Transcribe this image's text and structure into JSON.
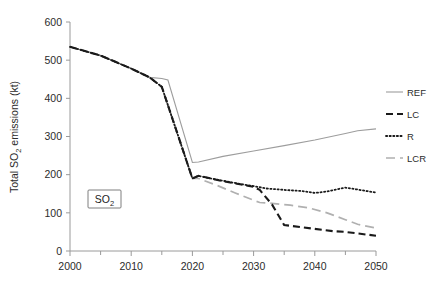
{
  "chart_data": {
    "type": "line",
    "title": "",
    "xlabel": "",
    "ylabel_parts": {
      "pre": "Total SO",
      "sub": "2",
      "post": " emissions (kt)"
    },
    "ylabel": "Total SO2 emissions (kt)",
    "xlim": [
      2000,
      2050
    ],
    "ylim": [
      0,
      600
    ],
    "xticks": [
      2000,
      2010,
      2020,
      2030,
      2040,
      2050
    ],
    "xticks_minor": [
      2005,
      2015,
      2025,
      2035,
      2045
    ],
    "yticks": [
      0,
      100,
      200,
      300,
      400,
      500,
      600
    ],
    "grid": false,
    "legend_position": "right",
    "annotations": [
      {
        "name": "so2-box",
        "text_pre": "SO",
        "text_sub": "2",
        "text": "SO2",
        "x": 2006.5,
        "y": 135
      }
    ],
    "series": [
      {
        "name": "REF",
        "style": "solid-thin-gray",
        "color": "#9d9d9d",
        "x": [
          2000,
          2005,
          2010,
          2013,
          2015,
          2016,
          2020,
          2021,
          2025,
          2030,
          2035,
          2040,
          2045,
          2047,
          2050
        ],
        "values": [
          535,
          512,
          478,
          455,
          452,
          448,
          232,
          233,
          248,
          262,
          276,
          291,
          308,
          315,
          320
        ]
      },
      {
        "name": "LC",
        "style": "dashed-black",
        "color": "#1a1a1a",
        "x": [
          2000,
          2005,
          2010,
          2013,
          2015,
          2020,
          2021,
          2023,
          2025,
          2028,
          2030,
          2031,
          2033,
          2035,
          2038,
          2040,
          2043,
          2045,
          2048,
          2050
        ],
        "values": [
          535,
          512,
          478,
          455,
          430,
          190,
          197,
          190,
          183,
          174,
          168,
          160,
          122,
          68,
          62,
          58,
          52,
          50,
          44,
          40
        ]
      },
      {
        "name": "R",
        "style": "dotted-black",
        "color": "#1a1a1a",
        "x": [
          2000,
          2005,
          2010,
          2013,
          2015,
          2020,
          2021,
          2023,
          2025,
          2028,
          2030,
          2032,
          2035,
          2038,
          2040,
          2042,
          2044,
          2045,
          2047,
          2050
        ],
        "values": [
          535,
          512,
          478,
          455,
          430,
          190,
          197,
          190,
          184,
          175,
          170,
          164,
          160,
          157,
          152,
          156,
          163,
          166,
          161,
          153
        ]
      },
      {
        "name": "LCR",
        "style": "longdash-gray",
        "color": "#b0b0b0",
        "x": [
          2000,
          2005,
          2010,
          2013,
          2015,
          2020,
          2021,
          2024,
          2027,
          2030,
          2031,
          2033,
          2036,
          2039,
          2042,
          2045,
          2047,
          2050
        ],
        "values": [
          535,
          512,
          478,
          455,
          430,
          190,
          190,
          172,
          152,
          133,
          127,
          125,
          120,
          113,
          100,
          82,
          70,
          60
        ]
      }
    ]
  },
  "legend": {
    "items": [
      {
        "label": "REF",
        "style": "solid-thin-gray"
      },
      {
        "label": "LC",
        "style": "dashed-black"
      },
      {
        "label": "R",
        "style": "dotted-black"
      },
      {
        "label": "LCR",
        "style": "longdash-gray"
      }
    ]
  },
  "axes": {
    "x_tick_labels": [
      "2000",
      "2010",
      "2020",
      "2030",
      "2040",
      "2050"
    ],
    "y_tick_labels": [
      "0",
      "100",
      "200",
      "300",
      "400",
      "500",
      "600"
    ]
  }
}
